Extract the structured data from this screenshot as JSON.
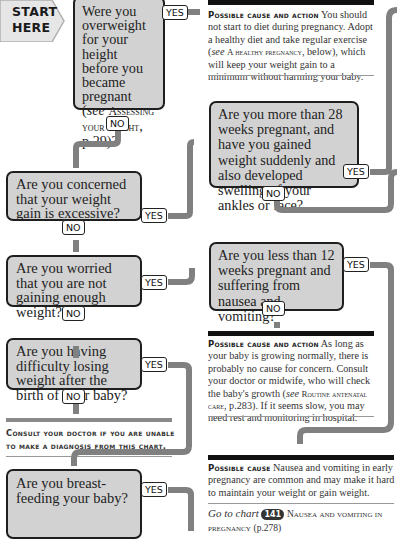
{
  "start": {
    "line1": "START",
    "line2": "HERE"
  },
  "questions": [
    {
      "id": "q1",
      "text_a": "Were you overweight for your height before you became pregnant (",
      "see": "see",
      "ref": "Assessing your weight",
      "text_b": ", p.29)?",
      "yes": "YES",
      "no": "NO"
    },
    {
      "id": "q2",
      "text": "Are you concerned that your weight gain is excessive?",
      "yes": "YES",
      "no": "NO"
    },
    {
      "id": "q3",
      "text": "Are you worried that you are not gaining enough weight?",
      "yes": "YES",
      "no": "NO"
    },
    {
      "id": "q4",
      "text": "Are you having difficulty losing weight after the birth of your baby?",
      "yes": "YES",
      "no": "NO"
    },
    {
      "id": "q5",
      "text": "Are you breast-feeding your baby?",
      "yes": "YES"
    },
    {
      "id": "q6",
      "text": "Are you more than 28 weeks pregnant, and have you gained weight suddenly and also developed swelling of your ankles or face?",
      "yes": "YES",
      "no": "NO"
    },
    {
      "id": "q7",
      "text": "Are you less than 12 weeks pregnant and suffering from nausea and vomiting?",
      "yes": "YES",
      "no": "NO"
    }
  ],
  "results": [
    {
      "id": "r1",
      "heading": "Possible cause and action",
      "text_a": "You should not start to diet during pregnancy. Adopt a healthy diet and take regular exercise (",
      "see": "see",
      "ref": "A healthy pregnancy",
      "text_b": ", below), which will keep your weight gain to a minimum without harming your baby."
    },
    {
      "id": "r2",
      "heading": "Possible cause and action",
      "text_a": "As long as your baby is growing normally, there is probably no cause for concern. Consult your doctor or midwife, who will check the baby's growth (",
      "see": "see",
      "ref": "Routine antenatal care",
      "text_b": ", p.283). If it seems slow, you may need rest and monitoring in hospital."
    },
    {
      "id": "r3",
      "heading": "Possible cause",
      "text": "Nausea and vomiting in early pregnancy are common and may make it hard to maintain your weight or gain weight."
    }
  ],
  "goto": {
    "prefix": "Go to chart",
    "chart_number": "141",
    "title": "Nausea and vomiting in pregnancy",
    "page": "(p.278)"
  },
  "consult": {
    "text": "Consult your doctor if you are unable to make a diagnosis from this chart."
  },
  "colors": {
    "box_fill": "#d2d2d2",
    "box_border": "#1e1e1e",
    "pipe": "#808080",
    "rule": "#111111"
  }
}
